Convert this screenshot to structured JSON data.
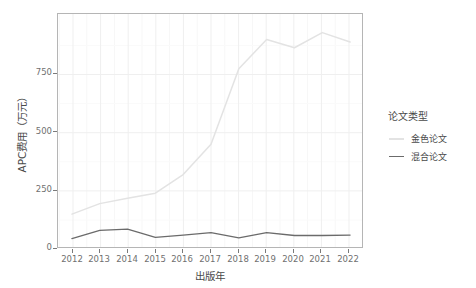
{
  "chart_data": {
    "type": "line",
    "title": "",
    "xlabel": "出版年",
    "ylabel": "APC费用（万元）",
    "x": [
      2012,
      2013,
      2014,
      2015,
      2016,
      2017,
      2018,
      2019,
      2020,
      2021,
      2022
    ],
    "xticklabels": [
      "2012",
      "2013",
      "2014",
      "2015",
      "2016",
      "2017",
      "2018",
      "2019",
      "2020",
      "2021",
      "2022"
    ],
    "yticklabels": [
      "0",
      "250",
      "500",
      "750"
    ],
    "ytickvalues": [
      0,
      250,
      500,
      750
    ],
    "xlim": [
      2011.5,
      2022.5
    ],
    "ylim": [
      0,
      1010
    ],
    "grid": true,
    "legend_position": "right",
    "legend_title": "论文类型",
    "series": [
      {
        "name": "金色论文",
        "color": "#e3e3e3",
        "values": [
          150,
          195,
          218,
          240,
          320,
          450,
          775,
          900,
          865,
          930,
          890
        ]
      },
      {
        "name": "混合论文",
        "color": "#6b6b6b",
        "values": [
          45,
          80,
          85,
          50,
          60,
          70,
          48,
          70,
          58,
          58,
          60
        ]
      }
    ]
  },
  "axes": {
    "y_title": "APC费用（万元）",
    "x_title": "出版年",
    "y_ticks": [
      "750",
      "500",
      "250",
      "0"
    ],
    "x_ticks": [
      "2012",
      "2013",
      "2014",
      "2015",
      "2016",
      "2017",
      "2018",
      "2019",
      "2020",
      "2021",
      "2022"
    ]
  },
  "legend": {
    "title": "论文类型",
    "items": [
      {
        "label": "金色论文",
        "color": "#e3e3e3"
      },
      {
        "label": "混合论文",
        "color": "#6b6b6b"
      }
    ]
  },
  "colors": {
    "panel_border": "#b5b5b5",
    "grid_major": "#ededed",
    "grid_minor": "#f6f6f6",
    "tick_text": "#707070",
    "axis_title": "#4a4a4a",
    "background": "#ffffff"
  }
}
